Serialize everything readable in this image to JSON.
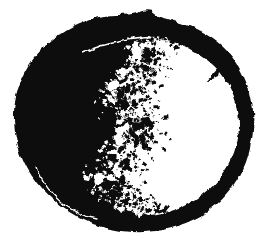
{
  "meta": {
    "background_color": "#ffffff"
  },
  "moon": {
    "ink_color": "#0a0a0a",
    "paper_color": "#ffffff",
    "blob_path": "M138,13 C143,10 150,9 154,13 C158,17 166,18 174,21 C196,27 214,37 228,52 C241,67 249,85 252,103 C255,122 253,143 246,162 C239,181 227,197 211,209 C196,220 177,228 156,231 C135,234 113,231 93,224 C73,216 55,204 41,188 C27,172 18,152 15,132 C12,112 15,92 24,74 C33,56 48,41 66,30 C84,19 104,14 120,15 C126,15 132,14 138,13 Z",
    "lit_path": "M162,37 C186,44 206,56 220,72 C233,88 239,106 239,124 C239,144 232,163 219,179 C206,195 188,207 167,213 C160,215 153,216 148,216 L138,212 L126,206 L131,199 L118,200 L124,192 L110,190 L116,183 L103,178 L112,172 L107,164 L118,162 L110,152 L121,148 L115,140 L127,136 L122,128 L128,120 L119,112 L126,105 L115,99 L124,92 L119,84 L130,78 L124,70 L136,64 L131,56 L143,52 L139,44 L151,42 L148,36 Z",
    "top_arc_path": "M82,53 C100,45 121,40 142,38 C150,37 159,37 167,38",
    "bottom_arc_path": "M37,167 C42,182 52,196 66,206 C76,213 86,217 97,219",
    "ring_spike_path": "M222,64 L206,82 L219,76 Z",
    "speckles": {
      "seed": 11,
      "count": 780,
      "blob_count": 16,
      "spread": 26,
      "y_min": 36,
      "y_max": 214,
      "terminator": [
        [
          150,
          38
        ],
        [
          140,
          56
        ],
        [
          126,
          76
        ],
        [
          117,
          96
        ],
        [
          122,
          112
        ],
        [
          130,
          124
        ],
        [
          123,
          140
        ],
        [
          114,
          158
        ],
        [
          104,
          176
        ],
        [
          108,
          190
        ],
        [
          122,
          202
        ],
        [
          146,
          214
        ]
      ]
    }
  }
}
